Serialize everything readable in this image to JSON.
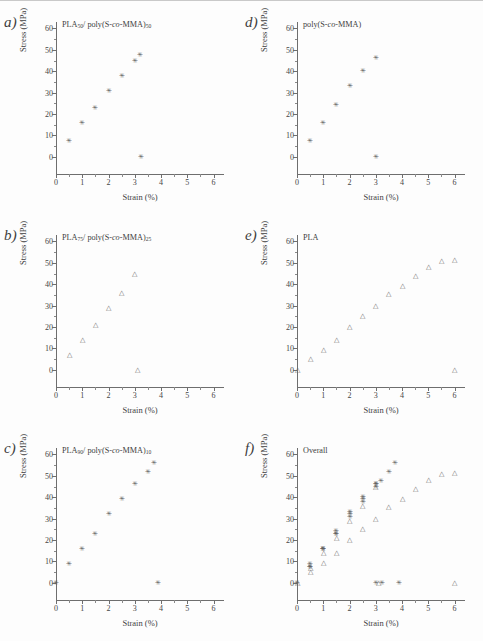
{
  "figure": {
    "axis_labels": {
      "x": "Strain (%)",
      "y": "Stress (MPa)"
    },
    "x_ticks": [
      "0",
      "1",
      "2",
      "3",
      "4",
      "5",
      "6"
    ],
    "y_ticks": [
      "0",
      "10",
      "20",
      "30",
      "40",
      "50",
      "60"
    ],
    "marker_star": "✳",
    "marker_triangle": "△",
    "colors": {
      "axis": "#6e6e6e",
      "text": "#3f3f3f",
      "star": "#5c5c5c",
      "triangle": "#6a6a6a"
    }
  },
  "panels": [
    {
      "label": "a)",
      "title_html": "PLA<sub>50</sub>/ poly(S-<i>co</i>-MMA)<sub>50</sub>"
    },
    {
      "label": "b)",
      "title_html": "PLA<sub>75</sub>/ poly(S-<i>co</i>-MMA)<sub>25</sub>"
    },
    {
      "label": "c)",
      "title_html": "PLA<sub>90</sub>/ poly(S-<i>co</i>-MMA)<sub>10</sub>"
    },
    {
      "label": "d)",
      "title_html": "poly(S-<i>co</i>-MMA)"
    },
    {
      "label": "e)",
      "title_html": "PLA"
    },
    {
      "label": "f)",
      "title_html": "Overall"
    }
  ],
  "chart_data": [
    {
      "type": "scatter",
      "panel": "a",
      "title": "PLA50/poly(S-co-MMA)50",
      "xlabel": "Strain (%)",
      "ylabel": "Stress (MPa)",
      "xlim": [
        0,
        6.4
      ],
      "ylim": [
        -8,
        63
      ],
      "grid": false,
      "legend": "none",
      "series": [
        {
          "name": "PLA50/poly(S-co-MMA)50",
          "marker": "star",
          "x": [
            0.5,
            1.0,
            1.5,
            2.0,
            2.5,
            3.0,
            3.2,
            3.25
          ],
          "y": [
            7.5,
            16.0,
            23.0,
            31.0,
            38.0,
            45.0,
            47.5,
            0.0
          ]
        }
      ]
    },
    {
      "type": "scatter",
      "panel": "b",
      "title": "PLA75/poly(S-co-MMA)25",
      "xlabel": "Strain (%)",
      "ylabel": "Stress (MPa)",
      "xlim": [
        0,
        6.4
      ],
      "ylim": [
        -8,
        63
      ],
      "grid": false,
      "legend": "none",
      "series": [
        {
          "name": "PLA75/poly(S-co-MMA)25",
          "marker": "triangle",
          "x": [
            0.5,
            1.0,
            1.5,
            2.0,
            2.5,
            3.0,
            3.1
          ],
          "y": [
            7.0,
            14.0,
            21.0,
            29.0,
            36.0,
            45.0,
            0.0
          ]
        }
      ]
    },
    {
      "type": "scatter",
      "panel": "c",
      "title": "PLA90/poly(S-co-MMA)10",
      "xlabel": "Strain (%)",
      "ylabel": "Stress (MPa)",
      "xlim": [
        0,
        6.4
      ],
      "ylim": [
        -8,
        63
      ],
      "grid": false,
      "legend": "none",
      "series": [
        {
          "name": "PLA90/poly(S-co-MMA)10",
          "marker": "star",
          "x": [
            0.0,
            0.5,
            1.0,
            1.5,
            2.0,
            2.5,
            3.0,
            3.5,
            3.75,
            3.9
          ],
          "y": [
            0.0,
            9.0,
            16.0,
            23.0,
            32.0,
            39.0,
            46.0,
            52.0,
            56.0,
            0.0
          ]
        }
      ]
    },
    {
      "type": "scatter",
      "panel": "d",
      "title": "poly(S-co-MMA)",
      "xlabel": "Strain (%)",
      "ylabel": "Stress (MPa)",
      "xlim": [
        0,
        6.4
      ],
      "ylim": [
        -8,
        63
      ],
      "grid": false,
      "legend": "none",
      "series": [
        {
          "name": "poly(S-co-MMA)",
          "marker": "star",
          "x": [
            0.5,
            1.0,
            1.5,
            2.0,
            2.5,
            3.0,
            3.0
          ],
          "y": [
            7.5,
            16.0,
            24.0,
            33.0,
            40.0,
            46.0,
            0.0
          ]
        }
      ]
    },
    {
      "type": "scatter",
      "panel": "e",
      "title": "PLA",
      "xlabel": "Strain (%)",
      "ylabel": "Stress (MPa)",
      "xlim": [
        0,
        6.4
      ],
      "ylim": [
        -8,
        63
      ],
      "grid": false,
      "legend": "none",
      "series": [
        {
          "name": "PLA",
          "marker": "triangle",
          "x": [
            0.0,
            0.5,
            1.0,
            1.5,
            2.0,
            2.5,
            3.0,
            3.5,
            4.0,
            4.5,
            5.0,
            5.5,
            6.0,
            6.0
          ],
          "y": [
            0.0,
            5.0,
            9.5,
            14.0,
            20.0,
            25.0,
            30.0,
            35.5,
            39.0,
            44.0,
            48.0,
            51.0,
            51.5,
            0.0
          ]
        }
      ]
    },
    {
      "type": "scatter",
      "panel": "f",
      "title": "Overall",
      "xlabel": "Strain (%)",
      "ylabel": "Stress (MPa)",
      "xlim": [
        0,
        6.4
      ],
      "ylim": [
        -8,
        63
      ],
      "grid": false,
      "legend": "none",
      "series": [
        {
          "name": "PLA50/poly(S-co-MMA)50",
          "marker": "star",
          "x": [
            0.5,
            1.0,
            1.5,
            2.0,
            2.5,
            3.0,
            3.2,
            3.25
          ],
          "y": [
            7.5,
            16.0,
            23.0,
            31.0,
            38.0,
            45.0,
            47.5,
            0.0
          ]
        },
        {
          "name": "PLA75/poly(S-co-MMA)25",
          "marker": "triangle",
          "x": [
            0.5,
            1.0,
            1.5,
            2.0,
            2.5,
            3.0,
            3.1
          ],
          "y": [
            7.0,
            14.0,
            21.0,
            29.0,
            36.0,
            45.0,
            0.0
          ]
        },
        {
          "name": "PLA90/poly(S-co-MMA)10",
          "marker": "star",
          "x": [
            0.0,
            0.5,
            1.0,
            1.5,
            2.0,
            2.5,
            3.0,
            3.5,
            3.75,
            3.9
          ],
          "y": [
            0.0,
            9.0,
            16.0,
            23.0,
            32.0,
            39.0,
            46.0,
            52.0,
            56.0,
            0.0
          ]
        },
        {
          "name": "poly(S-co-MMA)",
          "marker": "star",
          "x": [
            0.5,
            1.0,
            1.5,
            2.0,
            2.5,
            3.0,
            3.0
          ],
          "y": [
            7.5,
            16.0,
            24.0,
            33.0,
            40.0,
            46.0,
            0.0
          ]
        },
        {
          "name": "PLA",
          "marker": "triangle",
          "x": [
            0.0,
            0.5,
            1.0,
            1.5,
            2.0,
            2.5,
            3.0,
            3.5,
            4.0,
            4.5,
            5.0,
            5.5,
            6.0,
            6.0
          ],
          "y": [
            0.0,
            5.0,
            9.5,
            14.0,
            20.0,
            25.0,
            30.0,
            35.5,
            39.0,
            44.0,
            48.0,
            51.0,
            51.5,
            0.0
          ]
        }
      ]
    }
  ]
}
